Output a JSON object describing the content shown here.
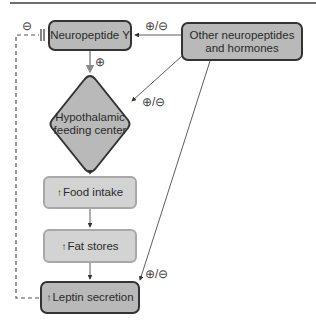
{
  "diagram": {
    "nodes": {
      "npy": {
        "label": "Neuropeptide Y"
      },
      "other": {
        "line1": "Other neuropeptides",
        "line2": "and hormones"
      },
      "hypothalamic": {
        "line1": "Hypothalamic",
        "line2": "feeding center"
      },
      "food_intake": {
        "arrow": "↑",
        "label": "Food intake"
      },
      "fat_stores": {
        "arrow": "↑",
        "label": "Fat stores"
      },
      "leptin": {
        "arrow": "↑",
        "label": "Leptin secretion"
      }
    },
    "edges": [
      {
        "from": "npy",
        "to": "hypothalamic",
        "sign": "⊕"
      },
      {
        "from": "other",
        "to": "npy",
        "sign": "⊕/⊖"
      },
      {
        "from": "other",
        "to": "hypothalamic",
        "sign": "⊕/⊖"
      },
      {
        "from": "hypothalamic",
        "to": "food_intake",
        "sign": ""
      },
      {
        "from": "food_intake",
        "to": "fat_stores",
        "sign": ""
      },
      {
        "from": "fat_stores",
        "to": "leptin",
        "sign": ""
      },
      {
        "from": "other",
        "to": "leptin",
        "sign": "⊕/⊖"
      },
      {
        "from": "leptin",
        "to": "npy",
        "sign": "⊖",
        "style": "dashed-inhibitory"
      }
    ],
    "signs": {
      "npy_to_hypo": "⊕",
      "other_to_npy": "⊕/⊖",
      "other_to_hypo": "⊕/⊖",
      "other_to_leptin": "⊕/⊖",
      "leptin_to_npy": "⊖"
    },
    "colors": {
      "dark_fill": "#b9b9b9",
      "light_fill": "#d3d3d3",
      "dark_border": "#333333",
      "light_border": "#a8a8a8",
      "npy_arrow": "#8a8a8a"
    }
  }
}
